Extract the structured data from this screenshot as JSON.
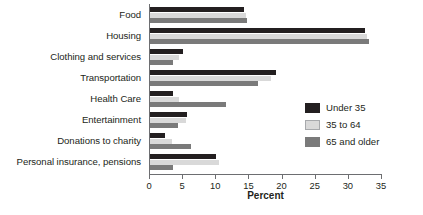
{
  "chart_data": {
    "type": "bar",
    "orientation": "horizontal",
    "title": "",
    "xlabel": "Percent",
    "ylabel": "",
    "xlim": [
      0,
      35
    ],
    "xticks": [
      0,
      5,
      10,
      15,
      20,
      25,
      30,
      35
    ],
    "grid": false,
    "legend_position": "right",
    "categories": [
      "Food",
      "Housing",
      "Clothing and services",
      "Transportation",
      "Health Care",
      "Entertainment",
      "Donations to charity",
      "Personal insurance, pensions"
    ],
    "series": [
      {
        "name": "Under 35",
        "color": "#231f20",
        "values": [
          14.2,
          32.5,
          5.0,
          19.0,
          3.4,
          5.6,
          2.3,
          10.0
        ]
      },
      {
        "name": "35 to 64",
        "color": "#d9d9d9",
        "values": [
          14.5,
          32.8,
          4.4,
          18.3,
          4.3,
          5.4,
          3.3,
          10.4
        ]
      },
      {
        "name": "65 and older",
        "color": "#7a7a7a",
        "values": [
          14.7,
          33.0,
          3.5,
          16.3,
          11.5,
          4.2,
          6.2,
          3.5
        ]
      }
    ]
  },
  "axis": {
    "x_title": "Percent",
    "tick_labels": [
      "0",
      "5",
      "10",
      "15",
      "20",
      "25",
      "30",
      "35"
    ]
  },
  "legend": {
    "entries": [
      {
        "label": "Under 35",
        "swatch": "legend-swatch-under-35"
      },
      {
        "label": "35 to 64",
        "swatch": "legend-swatch-35-to-64"
      },
      {
        "label": "65 and older",
        "swatch": "legend-swatch-65-and-older"
      }
    ]
  },
  "colors": {
    "series_under_35": "#231f20",
    "series_35_to_64": "#d9d9d9",
    "series_65_and_older": "#7a7a7a",
    "axis": "#6d6e71",
    "text": "#231f20",
    "background": "#ffffff"
  }
}
